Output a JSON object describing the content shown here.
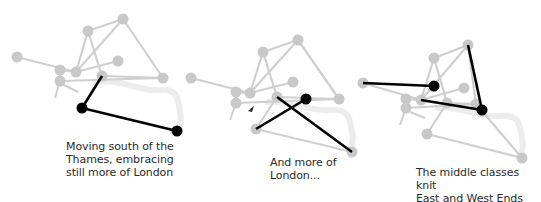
{
  "colors": {
    "background": "#ffffff",
    "node_gray": "#c8c8c8",
    "edge_gray": "#cfcfcf",
    "river": "#ececec",
    "highlight": "#000000",
    "text": "#2a2a2a"
  },
  "panels": [
    {
      "id": "panel-1",
      "caption": "Moving south of the\nThames, embracing\nstill more of London",
      "caption_pos": {
        "x": 66,
        "y": 140
      },
      "river": "M 95 82 C 120 78 140 92 160 90 C 178 88 178 100 180 112 C 182 120 180 125 178 130",
      "nodes": [
        {
          "id": "A",
          "x": 123,
          "y": 19
        },
        {
          "id": "B",
          "x": 88,
          "y": 31
        },
        {
          "id": "C",
          "x": 17,
          "y": 57
        },
        {
          "id": "D",
          "x": 118,
          "y": 61
        },
        {
          "id": "E",
          "x": 60,
          "y": 70
        },
        {
          "id": "F",
          "x": 76,
          "y": 72
        },
        {
          "id": "G",
          "x": 102,
          "y": 76
        },
        {
          "id": "H",
          "x": 163,
          "y": 78
        },
        {
          "id": "I",
          "x": 60,
          "y": 81
        },
        {
          "id": "J",
          "x": 82,
          "y": 108,
          "highlight": true
        },
        {
          "id": "K",
          "x": 177,
          "y": 131,
          "highlight": true
        }
      ],
      "edges": [
        {
          "from": "A",
          "to": "B"
        },
        {
          "from": "A",
          "to": "H"
        },
        {
          "from": "B",
          "to": "F"
        },
        {
          "from": "B",
          "to": "G"
        },
        {
          "from": "A",
          "to": "F"
        },
        {
          "from": "C",
          "to": "F"
        },
        {
          "from": "F",
          "to": "D"
        },
        {
          "from": "E",
          "to": "F"
        },
        {
          "from": "G",
          "to": "H"
        },
        {
          "from": "I",
          "to": "H"
        },
        {
          "from": "E",
          "to": "I"
        },
        {
          "from": "G",
          "to": "J",
          "highlight": true
        },
        {
          "from": "J",
          "to": "K",
          "highlight": true
        }
      ],
      "stubs": [
        {
          "x1": 60,
          "y1": 81,
          "x2": 55,
          "y2": 98
        },
        {
          "x1": 62,
          "y1": 84,
          "x2": 78,
          "y2": 92
        }
      ]
    },
    {
      "id": "panel-2",
      "caption": "And more of\nLondon...",
      "caption_pos": {
        "x": 270,
        "y": 156
      },
      "river": "M 268 102 C 290 100 310 112 330 110 C 350 108 350 120 352 132 C 354 140 352 145 350 150",
      "nodes": [
        {
          "id": "A",
          "x": 298,
          "y": 40
        },
        {
          "id": "B",
          "x": 263,
          "y": 52
        },
        {
          "id": "C",
          "x": 191,
          "y": 78
        },
        {
          "id": "D",
          "x": 293,
          "y": 82
        },
        {
          "id": "E",
          "x": 236,
          "y": 92
        },
        {
          "id": "F",
          "x": 250,
          "y": 93
        },
        {
          "id": "G",
          "x": 277,
          "y": 97
        },
        {
          "id": "M",
          "x": 306,
          "y": 99,
          "highlight": true
        },
        {
          "id": "H",
          "x": 339,
          "y": 99
        },
        {
          "id": "I",
          "x": 236,
          "y": 103
        },
        {
          "id": "L",
          "x": 256,
          "y": 129
        },
        {
          "id": "K",
          "x": 352,
          "y": 152
        }
      ],
      "edges": [
        {
          "from": "A",
          "to": "B"
        },
        {
          "from": "A",
          "to": "H"
        },
        {
          "from": "B",
          "to": "F"
        },
        {
          "from": "B",
          "to": "G"
        },
        {
          "from": "A",
          "to": "F"
        },
        {
          "from": "C",
          "to": "F"
        },
        {
          "from": "F",
          "to": "D"
        },
        {
          "from": "E",
          "to": "F"
        },
        {
          "from": "G",
          "to": "H"
        },
        {
          "from": "I",
          "to": "H"
        },
        {
          "from": "E",
          "to": "I"
        },
        {
          "from": "G",
          "to": "L"
        },
        {
          "from": "L",
          "to": "K"
        },
        {
          "from": "M",
          "to": "L",
          "highlight": true
        },
        {
          "from": "G",
          "to": "K",
          "highlight": true
        }
      ],
      "stubs": [
        {
          "x1": 236,
          "y1": 103,
          "x2": 230,
          "y2": 120
        }
      ],
      "cursor": {
        "x": 248,
        "y": 106
      }
    },
    {
      "id": "panel-3",
      "caption": "The middle classes knit\nEast and West Ends\ninto a unified city",
      "caption_pos": {
        "x": 416,
        "y": 166
      },
      "river": "M 438 108 C 460 106 480 118 500 116 C 520 114 520 126 522 138 C 524 146 522 151 520 156",
      "nodes": [
        {
          "id": "A",
          "x": 468,
          "y": 45
        },
        {
          "id": "B",
          "x": 434,
          "y": 58
        },
        {
          "id": "C",
          "x": 363,
          "y": 83
        },
        {
          "id": "D",
          "x": 464,
          "y": 88
        },
        {
          "id": "E",
          "x": 406,
          "y": 99
        },
        {
          "id": "F",
          "x": 421,
          "y": 100
        },
        {
          "id": "G",
          "x": 447,
          "y": 103
        },
        {
          "id": "H",
          "x": 476,
          "y": 104
        },
        {
          "id": "I",
          "x": 406,
          "y": 108
        },
        {
          "id": "L",
          "x": 427,
          "y": 134
        },
        {
          "id": "K",
          "x": 522,
          "y": 158
        },
        {
          "id": "N",
          "x": 434,
          "y": 86,
          "highlight": true
        },
        {
          "id": "P",
          "x": 482,
          "y": 110,
          "highlight": true
        }
      ],
      "edges": [
        {
          "from": "A",
          "to": "B"
        },
        {
          "from": "A",
          "to": "H"
        },
        {
          "from": "B",
          "to": "F"
        },
        {
          "from": "B",
          "to": "G"
        },
        {
          "from": "A",
          "to": "F"
        },
        {
          "from": "C",
          "to": "F"
        },
        {
          "from": "F",
          "to": "D"
        },
        {
          "from": "E",
          "to": "F"
        },
        {
          "from": "G",
          "to": "H"
        },
        {
          "from": "I",
          "to": "H"
        },
        {
          "from": "E",
          "to": "I"
        },
        {
          "from": "G",
          "to": "L"
        },
        {
          "from": "L",
          "to": "K"
        },
        {
          "from": "H",
          "to": "K"
        },
        {
          "from": "C",
          "to": "N",
          "highlight": true
        },
        {
          "from": "A",
          "to": "P",
          "highlight": true
        },
        {
          "from": "F",
          "to": "P",
          "highlight": true
        }
      ],
      "stubs": [
        {
          "x1": 406,
          "y1": 108,
          "x2": 400,
          "y2": 125
        },
        {
          "x1": 410,
          "y1": 112,
          "x2": 425,
          "y2": 118
        }
      ]
    }
  ]
}
